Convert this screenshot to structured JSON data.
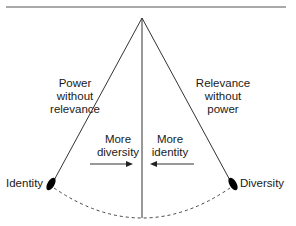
{
  "diagram": {
    "left_side_label": "Power\nwithout\nrelevance",
    "right_side_label": "Relevance\nwithout\npower",
    "left_arrow_label": "More\ndiversity",
    "right_arrow_label": "More\nidentity",
    "left_endpoint_label": "Identity",
    "right_endpoint_label": "Diversity",
    "left_arrow_direction": "right",
    "right_arrow_direction": "left",
    "line_color": "#333333",
    "node_color": "#000000"
  }
}
